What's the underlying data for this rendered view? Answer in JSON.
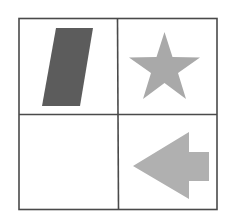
{
  "diagram": {
    "type": "2x2 shape grid puzzle",
    "grid": {
      "rows": 2,
      "cols": 2,
      "line_color": "#4a4a4a",
      "background": "#ffffff"
    },
    "cells": [
      {
        "row": 0,
        "col": 0,
        "shape": "parallelogram",
        "fill": "#5c5c5c"
      },
      {
        "row": 0,
        "col": 1,
        "shape": "star",
        "fill": "#a9a9a9"
      },
      {
        "row": 1,
        "col": 0,
        "shape": "empty",
        "fill": ""
      },
      {
        "row": 1,
        "col": 1,
        "shape": "left-arrow",
        "fill": "#b0b0b0"
      }
    ]
  }
}
